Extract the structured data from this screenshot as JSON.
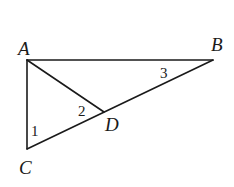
{
  "figure": {
    "type": "geometry-triangle",
    "points": [
      {
        "id": "A",
        "label": "A",
        "x": 27,
        "y": 60,
        "label_x": 18,
        "label_y": 55
      },
      {
        "id": "B",
        "label": "B",
        "x": 213,
        "y": 60,
        "label_x": 211,
        "label_y": 51
      },
      {
        "id": "C",
        "label": "C",
        "x": 27,
        "y": 149,
        "label_x": 19,
        "label_y": 174
      },
      {
        "id": "D",
        "label": "D",
        "x": 104,
        "y": 112,
        "label_x": 105,
        "label_y": 131
      }
    ],
    "segments": [
      {
        "id": "AB",
        "from": "A",
        "to": "B"
      },
      {
        "id": "AC",
        "from": "A",
        "to": "C"
      },
      {
        "id": "CB",
        "from": "C",
        "to": "B"
      },
      {
        "id": "AD",
        "from": "A",
        "to": "D"
      }
    ],
    "angles": [
      {
        "id": "angle-1",
        "label": "1",
        "vertex": "C",
        "x": 31,
        "y": 136
      },
      {
        "id": "angle-2",
        "label": "2",
        "vertex": "D",
        "x": 78,
        "y": 116
      },
      {
        "id": "angle-3",
        "label": "3",
        "vertex": "B",
        "x": 160,
        "y": 78
      }
    ],
    "colors": {
      "stroke": "#1a1a1a",
      "background": "#ffffff"
    }
  }
}
